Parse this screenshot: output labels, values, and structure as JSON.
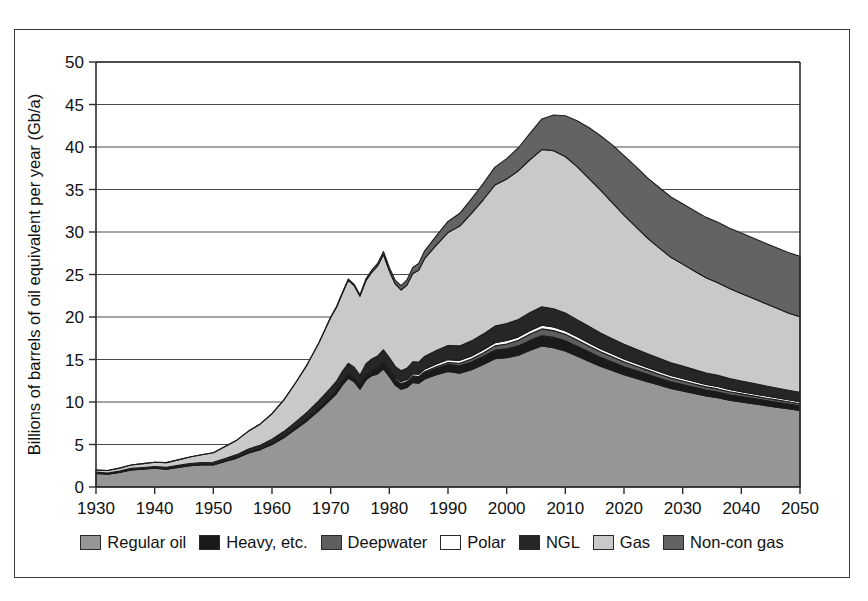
{
  "figure": {
    "frame_visible": true,
    "background_color": "#ffffff",
    "border_color": "#3a3a3a"
  },
  "chart_data": {
    "type": "area",
    "stacked": true,
    "title": "",
    "subtitle": "",
    "xlabel": "",
    "ylabel": "Billions of barrels of oil equivalent per year (Gb/a)",
    "xlim": [
      1930,
      2050
    ],
    "ylim": [
      0,
      50
    ],
    "ytick_values": [
      0,
      5,
      10,
      15,
      20,
      25,
      30,
      35,
      40,
      45,
      50
    ],
    "ytick_labels": [
      "0",
      "5",
      "10",
      "15",
      "20",
      "25",
      "30",
      "35",
      "40",
      "45",
      "50"
    ],
    "xtick_values": [
      1930,
      1940,
      1950,
      1960,
      1970,
      1980,
      1990,
      2000,
      2010,
      2020,
      2030,
      2040,
      2050
    ],
    "xtick_labels": [
      "1930",
      "1940",
      "1950",
      "1960",
      "1970",
      "1980",
      "1990",
      "2000",
      "2010",
      "2020",
      "2030",
      "2040",
      "2050"
    ],
    "grid": true,
    "grid_axis": "y",
    "legend_position": "bottom",
    "x": [
      1930,
      1932,
      1934,
      1936,
      1938,
      1940,
      1942,
      1944,
      1946,
      1948,
      1950,
      1952,
      1954,
      1956,
      1958,
      1960,
      1962,
      1964,
      1966,
      1968,
      1970,
      1971,
      1972,
      1973,
      1974,
      1975,
      1976,
      1977,
      1978,
      1979,
      1980,
      1981,
      1982,
      1983,
      1984,
      1985,
      1986,
      1988,
      1990,
      1992,
      1994,
      1996,
      1998,
      2000,
      2002,
      2004,
      2006,
      2008,
      2010,
      2012,
      2014,
      2016,
      2018,
      2020,
      2022,
      2024,
      2026,
      2028,
      2030,
      2032,
      2034,
      2036,
      2038,
      2040,
      2042,
      2044,
      2046,
      2048,
      2050
    ],
    "series": [
      {
        "name": "Regular oil",
        "color": "#969696",
        "values": [
          1.6,
          1.5,
          1.7,
          2.0,
          2.1,
          2.2,
          2.1,
          2.3,
          2.5,
          2.6,
          2.6,
          3.0,
          3.4,
          4.0,
          4.4,
          5.0,
          5.8,
          6.8,
          7.8,
          9.0,
          10.3,
          11.0,
          12.0,
          12.8,
          12.4,
          11.5,
          12.6,
          13.1,
          13.3,
          13.9,
          13.0,
          12.0,
          11.5,
          11.7,
          12.3,
          12.2,
          12.7,
          13.2,
          13.6,
          13.4,
          13.8,
          14.4,
          15.1,
          15.2,
          15.5,
          16.1,
          16.6,
          16.4,
          16.0,
          15.4,
          14.8,
          14.2,
          13.7,
          13.2,
          12.8,
          12.4,
          12.0,
          11.6,
          11.3,
          11.0,
          10.7,
          10.5,
          10.2,
          10.0,
          9.8,
          9.6,
          9.4,
          9.2,
          9.0
        ]
      },
      {
        "name": "Heavy, etc.",
        "color": "#1a1a1a",
        "values": [
          0.05,
          0.05,
          0.05,
          0.05,
          0.05,
          0.06,
          0.06,
          0.06,
          0.07,
          0.07,
          0.08,
          0.08,
          0.09,
          0.1,
          0.1,
          0.12,
          0.14,
          0.16,
          0.2,
          0.25,
          0.3,
          0.35,
          0.4,
          0.45,
          0.45,
          0.45,
          0.5,
          0.5,
          0.55,
          0.6,
          0.6,
          0.6,
          0.6,
          0.6,
          0.65,
          0.65,
          0.7,
          0.75,
          0.8,
          0.85,
          0.9,
          0.95,
          1.0,
          1.05,
          1.1,
          1.15,
          1.2,
          1.2,
          1.2,
          1.15,
          1.1,
          1.05,
          1.0,
          0.95,
          0.9,
          0.85,
          0.8,
          0.78,
          0.75,
          0.72,
          0.7,
          0.68,
          0.66,
          0.64,
          0.62,
          0.6,
          0.58,
          0.56,
          0.55
        ]
      },
      {
        "name": "Deepwater",
        "color": "#5e5e5e",
        "values": [
          0.0,
          0.0,
          0.0,
          0.0,
          0.0,
          0.0,
          0.0,
          0.0,
          0.0,
          0.0,
          0.0,
          0.0,
          0.0,
          0.0,
          0.0,
          0.0,
          0.0,
          0.0,
          0.0,
          0.0,
          0.0,
          0.0,
          0.0,
          0.0,
          0.0,
          0.0,
          0.02,
          0.03,
          0.04,
          0.05,
          0.06,
          0.07,
          0.08,
          0.1,
          0.12,
          0.14,
          0.16,
          0.2,
          0.25,
          0.3,
          0.35,
          0.42,
          0.5,
          0.58,
          0.66,
          0.74,
          0.8,
          0.8,
          0.78,
          0.74,
          0.7,
          0.66,
          0.62,
          0.58,
          0.54,
          0.5,
          0.47,
          0.44,
          0.42,
          0.4,
          0.38,
          0.36,
          0.34,
          0.32,
          0.3,
          0.28,
          0.27,
          0.26,
          0.25
        ]
      },
      {
        "name": "Polar",
        "color": "#ffffff",
        "values": [
          0.0,
          0.0,
          0.0,
          0.0,
          0.0,
          0.0,
          0.0,
          0.0,
          0.0,
          0.0,
          0.0,
          0.0,
          0.0,
          0.0,
          0.0,
          0.0,
          0.0,
          0.0,
          0.0,
          0.0,
          0.0,
          0.0,
          0.0,
          0.0,
          0.0,
          0.0,
          0.05,
          0.08,
          0.12,
          0.15,
          0.18,
          0.2,
          0.22,
          0.24,
          0.26,
          0.28,
          0.3,
          0.32,
          0.34,
          0.35,
          0.36,
          0.37,
          0.38,
          0.4,
          0.4,
          0.42,
          0.42,
          0.42,
          0.4,
          0.4,
          0.38,
          0.36,
          0.35,
          0.34,
          0.33,
          0.32,
          0.31,
          0.3,
          0.3,
          0.29,
          0.28,
          0.28,
          0.27,
          0.26,
          0.26,
          0.25,
          0.25,
          0.24,
          0.24
        ]
      },
      {
        "name": "NGL",
        "color": "#262626",
        "values": [
          0.1,
          0.1,
          0.12,
          0.14,
          0.15,
          0.16,
          0.16,
          0.18,
          0.2,
          0.22,
          0.24,
          0.28,
          0.32,
          0.38,
          0.42,
          0.5,
          0.58,
          0.68,
          0.8,
          0.92,
          1.05,
          1.1,
          1.2,
          1.3,
          1.25,
          1.2,
          1.3,
          1.35,
          1.4,
          1.45,
          1.4,
          1.32,
          1.28,
          1.32,
          1.4,
          1.42,
          1.5,
          1.58,
          1.65,
          1.7,
          1.78,
          1.85,
          1.95,
          2.0,
          2.05,
          2.12,
          2.18,
          2.15,
          2.1,
          2.0,
          1.92,
          1.85,
          1.78,
          1.72,
          1.65,
          1.6,
          1.55,
          1.5,
          1.45,
          1.4,
          1.36,
          1.32,
          1.28,
          1.25,
          1.22,
          1.18,
          1.15,
          1.12,
          1.1
        ]
      },
      {
        "name": "Gas",
        "color": "#c9c9c9",
        "values": [
          0.25,
          0.3,
          0.35,
          0.4,
          0.45,
          0.5,
          0.55,
          0.65,
          0.75,
          0.9,
          1.1,
          1.4,
          1.7,
          2.1,
          2.5,
          3.0,
          3.7,
          4.6,
          5.6,
          6.8,
          8.3,
          8.7,
          9.2,
          9.8,
          9.6,
          9.3,
          9.8,
          10.2,
          10.6,
          11.2,
          10.2,
          9.7,
          9.5,
          9.8,
          10.4,
          10.8,
          11.5,
          12.4,
          13.3,
          14.1,
          15.0,
          15.8,
          16.6,
          17.0,
          17.5,
          18.0,
          18.5,
          18.6,
          18.4,
          18.0,
          17.4,
          16.8,
          16.0,
          15.2,
          14.4,
          13.6,
          13.0,
          12.4,
          12.0,
          11.6,
          11.2,
          10.9,
          10.6,
          10.3,
          10.0,
          9.7,
          9.4,
          9.1,
          8.9
        ]
      },
      {
        "name": "Non-con gas",
        "color": "#636363",
        "values": [
          0.0,
          0.0,
          0.0,
          0.0,
          0.0,
          0.0,
          0.0,
          0.0,
          0.0,
          0.0,
          0.0,
          0.0,
          0.0,
          0.0,
          0.0,
          0.0,
          0.0,
          0.0,
          0.0,
          0.0,
          0.05,
          0.08,
          0.1,
          0.12,
          0.14,
          0.16,
          0.2,
          0.25,
          0.3,
          0.35,
          0.4,
          0.45,
          0.5,
          0.6,
          0.7,
          0.8,
          0.9,
          1.1,
          1.3,
          1.5,
          1.7,
          1.9,
          2.1,
          2.4,
          2.7,
          3.1,
          3.6,
          4.2,
          4.8,
          5.4,
          6.0,
          6.4,
          6.8,
          7.0,
          7.1,
          7.1,
          7.1,
          7.1,
          7.1,
          7.1,
          7.1,
          7.1,
          7.1,
          7.1,
          7.1,
          7.1,
          7.1,
          7.1,
          7.1
        ]
      }
    ],
    "annotations": []
  },
  "legend": {
    "items": [
      {
        "label": "Regular oil",
        "color": "#969696"
      },
      {
        "label": "Heavy, etc.",
        "color": "#1a1a1a"
      },
      {
        "label": "Deepwater",
        "color": "#5e5e5e"
      },
      {
        "label": "Polar",
        "color": "#ffffff"
      },
      {
        "label": "NGL",
        "color": "#262626"
      },
      {
        "label": "Gas",
        "color": "#c9c9c9"
      },
      {
        "label": "Non-con gas",
        "color": "#636363"
      }
    ]
  }
}
